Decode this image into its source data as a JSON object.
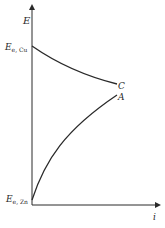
{
  "diagram": {
    "y_axis_label": "E",
    "x_axis_label": "i",
    "upper_label_main": "E",
    "upper_label_sub": "e, Cu",
    "lower_label_main": "E",
    "lower_label_sub": "e, Zn",
    "curve_c_label": "C",
    "curve_a_label": "A",
    "line_color": "#2a2a2a",
    "curves": [
      {
        "name": "C",
        "description": "cathodic polarization curve from E_e,Cu decreasing",
        "start": [
          32,
          46
        ],
        "end": [
          117,
          84
        ]
      },
      {
        "name": "A",
        "description": "anodic polarization curve from E_e,Zn increasing",
        "start": [
          32,
          200
        ],
        "end": [
          117,
          95
        ]
      }
    ]
  }
}
